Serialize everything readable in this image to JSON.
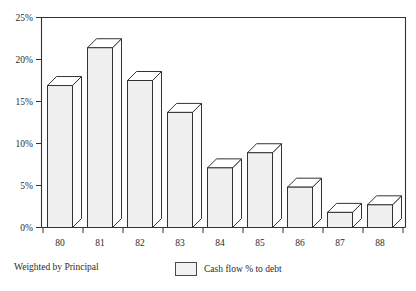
{
  "chart_data": {
    "type": "bar",
    "title": "",
    "xlabel": "",
    "ylabel": "",
    "categories": [
      "80",
      "81",
      "82",
      "83",
      "84",
      "85",
      "86",
      "87",
      "88"
    ],
    "values": [
      16.9,
      21.4,
      17.5,
      13.7,
      7.1,
      8.9,
      4.8,
      1.8,
      2.7
    ],
    "series": [
      {
        "name": "Cash flow % to debt",
        "values": [
          16.9,
          21.4,
          17.5,
          13.7,
          7.1,
          8.9,
          4.8,
          1.8,
          2.7
        ]
      }
    ],
    "ylim": [
      0,
      25
    ],
    "ytick_labels": [
      "0%",
      "5%",
      "10%",
      "15%",
      "20%",
      "25%"
    ],
    "ytick_values": [
      0,
      5,
      10,
      15,
      20,
      25
    ],
    "xtick_labels": [
      "80",
      "81",
      "82",
      "83",
      "84",
      "85",
      "86",
      "87",
      "88"
    ],
    "grid": false,
    "legend_position": "bottom-center",
    "style": "3d-bar",
    "bar_fill_color": "#f0f0f0",
    "bar_outline_color": "#333333",
    "axis_color": "#333333"
  },
  "legend": {
    "entries": [
      {
        "label": "Cash flow % to debt",
        "swatch_color": "#f2f2f2"
      }
    ]
  },
  "footnote": {
    "text": "Weighted by Principal"
  }
}
